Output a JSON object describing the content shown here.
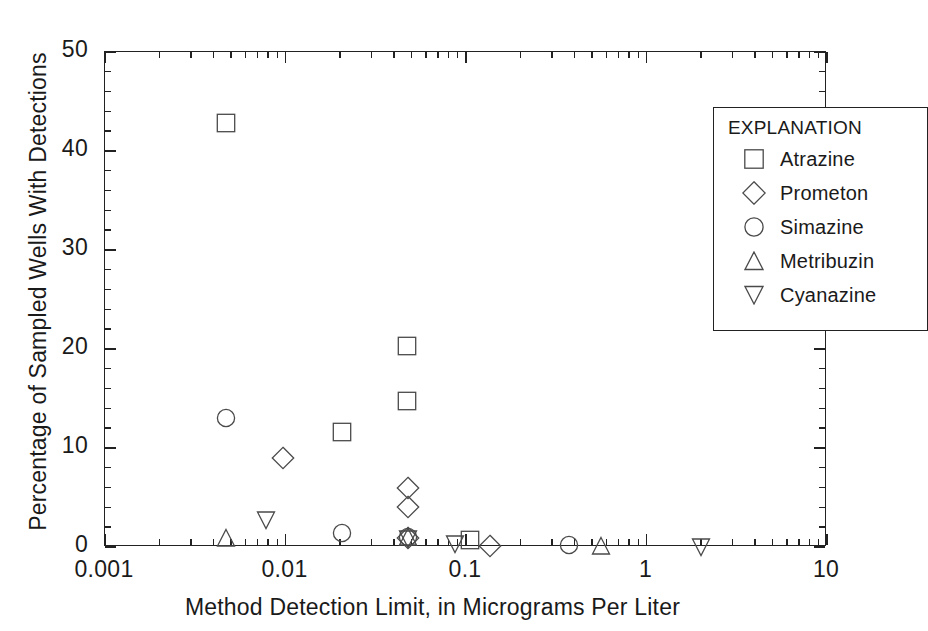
{
  "chart_data": {
    "type": "scatter",
    "title": "",
    "xlabel": "Method Detection Limit, in Micrograms Per Liter",
    "ylabel": "Percentage of Sampled Wells With Detections",
    "xscale": "log",
    "xlim": [
      0.001,
      10
    ],
    "ylim": [
      0,
      50
    ],
    "xtick_labels": [
      "0.001",
      "0.01",
      "0.1",
      "1",
      "10"
    ],
    "xtick_values": [
      0.001,
      0.01,
      0.1,
      1,
      10
    ],
    "ytick_labels": [
      "0",
      "10",
      "20",
      "30",
      "40",
      "50"
    ],
    "ytick_values": [
      0,
      10,
      20,
      30,
      40,
      50
    ],
    "y_minor_step": 2,
    "grid": false,
    "legend_position": "top-right",
    "legend_title": "EXPLANATION",
    "series": [
      {
        "name": "Atrazine",
        "marker": "square",
        "points": [
          {
            "x": 0.0047,
            "y": 42.8
          },
          {
            "x": 0.0205,
            "y": 11.6
          },
          {
            "x": 0.047,
            "y": 20.3
          },
          {
            "x": 0.047,
            "y": 14.7
          },
          {
            "x": 0.105,
            "y": 0.7
          }
        ]
      },
      {
        "name": "Prometon",
        "marker": "diamond",
        "points": [
          {
            "x": 0.0097,
            "y": 9.0
          },
          {
            "x": 0.048,
            "y": 6.0
          },
          {
            "x": 0.048,
            "y": 4.0
          },
          {
            "x": 0.048,
            "y": 0.9
          },
          {
            "x": 0.135,
            "y": 0.1
          }
        ]
      },
      {
        "name": "Simazine",
        "marker": "circle",
        "points": [
          {
            "x": 0.0047,
            "y": 13.0
          },
          {
            "x": 0.0205,
            "y": 1.4
          },
          {
            "x": 0.048,
            "y": 1.0
          },
          {
            "x": 0.37,
            "y": 0.2
          }
        ]
      },
      {
        "name": "Metribuzin",
        "marker": "triangle-up",
        "points": [
          {
            "x": 0.0047,
            "y": 0.9
          },
          {
            "x": 0.048,
            "y": 1.0
          },
          {
            "x": 0.56,
            "y": 0.1
          }
        ]
      },
      {
        "name": "Cyanazine",
        "marker": "triangle-down",
        "points": [
          {
            "x": 0.0078,
            "y": 2.7
          },
          {
            "x": 0.048,
            "y": 0.8
          },
          {
            "x": 0.087,
            "y": 0.3
          },
          {
            "x": 2.0,
            "y": 0.0
          }
        ]
      }
    ]
  },
  "legend": {
    "title": "EXPLANATION",
    "items": [
      {
        "label": "Atrazine",
        "marker": "square"
      },
      {
        "label": "Prometon",
        "marker": "diamond"
      },
      {
        "label": "Simazine",
        "marker": "circle"
      },
      {
        "label": "Metribuzin",
        "marker": "triangle-up"
      },
      {
        "label": "Cyanazine",
        "marker": "triangle-down"
      }
    ]
  },
  "colors": {
    "axis": "#222222",
    "marker_stroke": "#4a4a4a",
    "background": "#ffffff"
  }
}
